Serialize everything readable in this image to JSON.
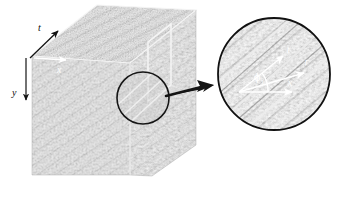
{
  "figure": {
    "name": "3d-material-block-with-magnified-inset",
    "background_color": "#ffffff"
  },
  "block": {
    "name": "ultrasound-tissue-block",
    "axes": [
      {
        "id": "t",
        "label": "t",
        "direction": "up-right",
        "arrow_color": "#1a1a1a"
      },
      {
        "id": "x",
        "label": "x",
        "direction": "right",
        "arrow_color": "#ffffff"
      },
      {
        "id": "y",
        "label": "y",
        "direction": "down",
        "arrow_color": "#1a1a1a"
      }
    ],
    "roi_rectangle": {
      "name": "roi-rectangle",
      "stroke": "#f2f2f2"
    },
    "roi_circle": {
      "name": "roi-circle",
      "stroke": "#161616"
    }
  },
  "callout": {
    "name": "magnifier-callout-arrow",
    "color": "#141414"
  },
  "inset": {
    "name": "magnified-circular-inset",
    "stroke": "#111111",
    "axes": [
      {
        "id": "t",
        "label": "t",
        "arrow_color": "#ffffff"
      },
      {
        "id": "r",
        "label": "r",
        "arrow_color": "#ffffff"
      },
      {
        "id": "x",
        "label": "x",
        "arrow_color": "#ffffff"
      }
    ],
    "angle": {
      "name": "angle-phi",
      "symbol": "ϕ",
      "subscript": "t",
      "arc_color": "#ffffff"
    },
    "streaks_color": "#eaeaea"
  }
}
